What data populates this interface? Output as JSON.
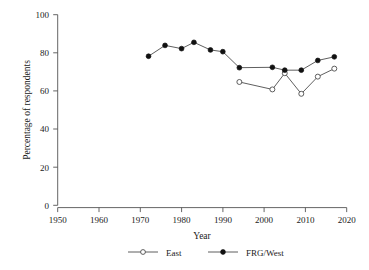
{
  "chart_data": {
    "type": "line",
    "title": "",
    "xlabel": "Year",
    "ylabel": "Percentage of respondents",
    "xlim": [
      1950,
      2020
    ],
    "ylim": [
      0,
      100
    ],
    "xticks": [
      1950,
      1960,
      1970,
      1980,
      1990,
      2000,
      2010,
      2020
    ],
    "yticks": [
      0,
      20,
      40,
      60,
      80,
      100
    ],
    "grid": false,
    "legend_position": "bottom",
    "series": [
      {
        "name": "East",
        "marker": "open-circle",
        "color": "#4d4d4d",
        "x": [
          1994,
          2002,
          2005,
          2009,
          2013,
          2017
        ],
        "values": [
          64.7,
          60.8,
          69.3,
          58.5,
          67.5,
          71.7
        ]
      },
      {
        "name": "FRG/West",
        "marker": "filled-circle",
        "color": "#111111",
        "x": [
          1972,
          1976,
          1980,
          1983,
          1987,
          1990,
          1994,
          2002,
          2005,
          2009,
          2013,
          2017
        ],
        "values": [
          78.2,
          83.9,
          82.2,
          85.5,
          81.5,
          80.6,
          72.2,
          72.4,
          70.9,
          70.9,
          76.0,
          77.9
        ]
      }
    ]
  },
  "axes": {
    "y_title": "Percentage of respondents",
    "x_title": "Year",
    "y_tick_labels": [
      "100",
      "80",
      "60",
      "40",
      "20",
      "0"
    ],
    "x_tick_labels": [
      "1950",
      "1960",
      "1970",
      "1980",
      "1990",
      "2000",
      "2010",
      "2020"
    ]
  },
  "legend": {
    "items": [
      {
        "label": "East",
        "marker": "open-circle-icon"
      },
      {
        "label": "FRG/West",
        "marker": "filled-circle-icon"
      }
    ]
  }
}
